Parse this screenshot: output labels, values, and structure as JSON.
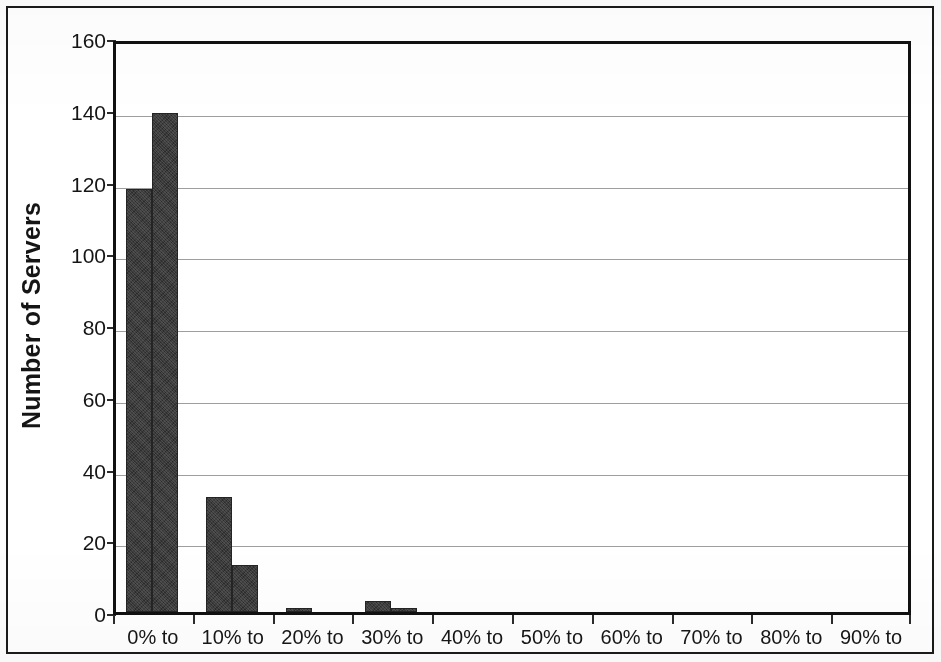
{
  "chart_data": {
    "type": "bar",
    "title": "",
    "subtitle": "",
    "xlabel": "",
    "ylabel": "Number of Servers",
    "categories": [
      "0% to",
      "10% to",
      "20% to",
      "30% to",
      "40% to",
      "50% to",
      "60% to",
      "70% to",
      "80% to",
      "90% to"
    ],
    "series": [
      {
        "name": "first",
        "values": [
          118,
          32,
          1,
          3,
          0,
          0,
          0,
          0,
          0,
          0
        ]
      },
      {
        "name": "second",
        "values": [
          139,
          13,
          0,
          1,
          0,
          0,
          0,
          0,
          0,
          0
        ]
      }
    ],
    "ylim": [
      0,
      160
    ],
    "ytick_values": [
      0,
      20,
      40,
      60,
      80,
      100,
      120,
      140,
      160
    ],
    "ytick_labels": [
      "0",
      "20",
      "40",
      "60",
      "80",
      "100",
      "120",
      "140",
      "160"
    ],
    "grid": true,
    "grid_axis": "y",
    "legend": false,
    "legend_position": "none",
    "bar_color": "#3a3a3a",
    "gridline_color": "#8d8d8d",
    "axis_color": "#111111",
    "background_color": "#ffffff"
  },
  "figure": {
    "frame_border_color": "#1a1a1a"
  }
}
